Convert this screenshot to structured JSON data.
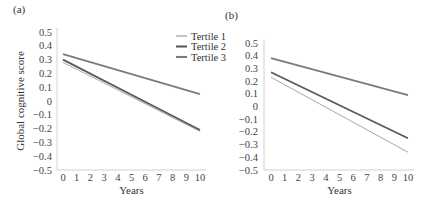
{
  "chart_data": [
    {
      "type": "line",
      "panel_label": "(a)",
      "title": "",
      "xlabel": "Years",
      "ylabel": "Global cognitive score",
      "x": [
        0,
        10
      ],
      "xticks": [
        "0",
        "1",
        "2",
        "3",
        "4",
        "5",
        "6",
        "7",
        "8",
        "9",
        "10"
      ],
      "yticks": [
        "0.5",
        "0.4",
        "0.3",
        "0.2",
        "0.1",
        "0",
        "−0.1",
        "−0.2",
        "−0.3",
        "−0.4",
        "−0.5"
      ],
      "ylim": [
        -0.5,
        0.5
      ],
      "xlim": [
        0,
        10
      ],
      "grid": false,
      "legend_position": "upper right",
      "series": [
        {
          "name": "Tertile 1",
          "values": [
            0.28,
            -0.22
          ],
          "color": "#a8a8a8",
          "width": 1.0
        },
        {
          "name": "Tertile 2",
          "values": [
            0.3,
            -0.21
          ],
          "color": "#5a5a5a",
          "width": 1.8
        },
        {
          "name": "Tertile 3",
          "values": [
            0.34,
            0.05
          ],
          "color": "#7a7a7a",
          "width": 1.8
        }
      ]
    },
    {
      "type": "line",
      "panel_label": "(b)",
      "title": "",
      "xlabel": "Years",
      "ylabel": "",
      "x": [
        0,
        10
      ],
      "xticks": [
        "0",
        "1",
        "2",
        "3",
        "4",
        "5",
        "6",
        "7",
        "8",
        "9",
        "10"
      ],
      "yticks": [
        "0.5",
        "0.4",
        "0.3",
        "0.2",
        "0.1",
        "0",
        "−0.1",
        "−0.2",
        "−0.3",
        "−0.4",
        "−0.5"
      ],
      "ylim": [
        -0.5,
        0.5
      ],
      "xlim": [
        0,
        10
      ],
      "grid": false,
      "series": [
        {
          "name": "Tertile 1",
          "values": [
            0.23,
            -0.36
          ],
          "color": "#a8a8a8",
          "width": 1.0
        },
        {
          "name": "Tertile 2",
          "values": [
            0.27,
            -0.25
          ],
          "color": "#5a5a5a",
          "width": 1.8
        },
        {
          "name": "Tertile 3",
          "values": [
            0.38,
            0.09
          ],
          "color": "#7a7a7a",
          "width": 1.8
        }
      ]
    }
  ],
  "legend": {
    "items": [
      "Tertile 1",
      "Tertile 2",
      "Tertile 3"
    ]
  }
}
